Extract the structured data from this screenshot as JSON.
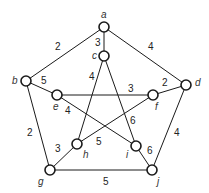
{
  "diagram": {
    "type": "weighted-graph",
    "nodes": [
      {
        "id": "a",
        "label": "a",
        "x": 104,
        "y": 27,
        "lx": 101,
        "ly": 18
      },
      {
        "id": "b",
        "label": "b",
        "x": 26,
        "y": 81,
        "lx": 12,
        "ly": 84
      },
      {
        "id": "c",
        "label": "c",
        "x": 104,
        "y": 56,
        "lx": 92,
        "ly": 59
      },
      {
        "id": "d",
        "label": "d",
        "x": 186,
        "y": 85,
        "lx": 195,
        "ly": 86
      },
      {
        "id": "e",
        "label": "e",
        "x": 57,
        "y": 95,
        "lx": 53,
        "ly": 110
      },
      {
        "id": "f",
        "label": "f",
        "x": 153,
        "y": 95,
        "lx": 155,
        "ly": 110
      },
      {
        "id": "g",
        "label": "g",
        "x": 50,
        "y": 170,
        "lx": 38,
        "ly": 185
      },
      {
        "id": "h",
        "label": "h",
        "x": 77,
        "y": 144,
        "lx": 83,
        "ly": 158
      },
      {
        "id": "i",
        "label": "i",
        "x": 136,
        "y": 146,
        "lx": 126,
        "ly": 158
      },
      {
        "id": "j",
        "label": "j",
        "x": 152,
        "y": 170,
        "lx": 157,
        "ly": 185
      }
    ],
    "edges": [
      {
        "from": "a",
        "to": "b",
        "weight": "2",
        "wx": 55,
        "wy": 50
      },
      {
        "from": "a",
        "to": "d",
        "weight": "4",
        "wx": 148,
        "wy": 50
      },
      {
        "from": "a",
        "to": "c",
        "weight": "3",
        "wx": 95,
        "wy": 46
      },
      {
        "from": "b",
        "to": "e",
        "weight": "5",
        "wx": 41,
        "wy": 84
      },
      {
        "from": "b",
        "to": "g",
        "weight": "2",
        "wx": 27,
        "wy": 136
      },
      {
        "from": "d",
        "to": "f",
        "weight": "2",
        "wx": 162,
        "wy": 86
      },
      {
        "from": "d",
        "to": "j",
        "weight": "4",
        "wx": 174,
        "wy": 136
      },
      {
        "from": "g",
        "to": "j",
        "weight": "5",
        "wx": 103,
        "wy": 185
      },
      {
        "from": "c",
        "to": "h",
        "weight": "4",
        "wx": 89,
        "wy": 80
      },
      {
        "from": "c",
        "to": "i",
        "weight": "6",
        "wx": 130,
        "wy": 124
      },
      {
        "from": "e",
        "to": "f",
        "weight": "3",
        "wx": 128,
        "wy": 92
      },
      {
        "from": "e",
        "to": "i",
        "weight": "4",
        "wx": 65,
        "wy": 114
      },
      {
        "from": "f",
        "to": "h",
        "weight": "5",
        "wx": 96,
        "wy": 145
      },
      {
        "from": "g",
        "to": "h",
        "weight": "3",
        "wx": 55,
        "wy": 152
      },
      {
        "from": "i",
        "to": "j",
        "weight": "6",
        "wx": 147,
        "wy": 154
      }
    ]
  }
}
